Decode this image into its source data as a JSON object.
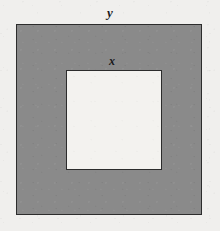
{
  "figure": {
    "background_color": "#f0efed",
    "canvas": {
      "width": 220,
      "height": 231
    },
    "outer_square": {
      "name": "outer-square",
      "label": "y",
      "fill_color": "#8a8a8a",
      "stroke_color": "#2c2c2c",
      "stroke_width": 1,
      "x": 16,
      "y": 24,
      "width": 186,
      "height": 191
    },
    "inner_square": {
      "name": "inner-square",
      "label": "x",
      "fill_color": "#f3f2ef",
      "stroke_color": "#2c2c2c",
      "stroke_width": 1,
      "x": 66,
      "y": 70,
      "width": 96,
      "height": 100
    },
    "labels": [
      {
        "id": "label-y",
        "text": "y",
        "describes": "outer-square-side-length",
        "x": 110,
        "y": 6,
        "font_size": 13,
        "style": "bold-italic-serif",
        "color": "#18181a"
      },
      {
        "id": "label-x",
        "text": "x",
        "describes": "inner-square-side-length",
        "x": 112,
        "y": 55,
        "font_size": 12,
        "style": "bold-italic-serif",
        "color": "#18181a"
      }
    ]
  },
  "chart_data": {
    "type": "diagram",
    "shapes": [
      {
        "shape": "square",
        "role": "outer",
        "label": "y",
        "fill": "#8a8a8a",
        "stroke": "#2c2c2c",
        "side_px": 188,
        "bbox": [
          16,
          24,
          202,
          215
        ]
      },
      {
        "shape": "square",
        "role": "inner",
        "label": "x",
        "fill": "#f3f2ef",
        "stroke": "#2c2c2c",
        "side_px": 98,
        "bbox": [
          66,
          70,
          162,
          170
        ]
      }
    ],
    "annotations": [
      "y",
      "x"
    ],
    "legend": "none",
    "grid": false
  }
}
